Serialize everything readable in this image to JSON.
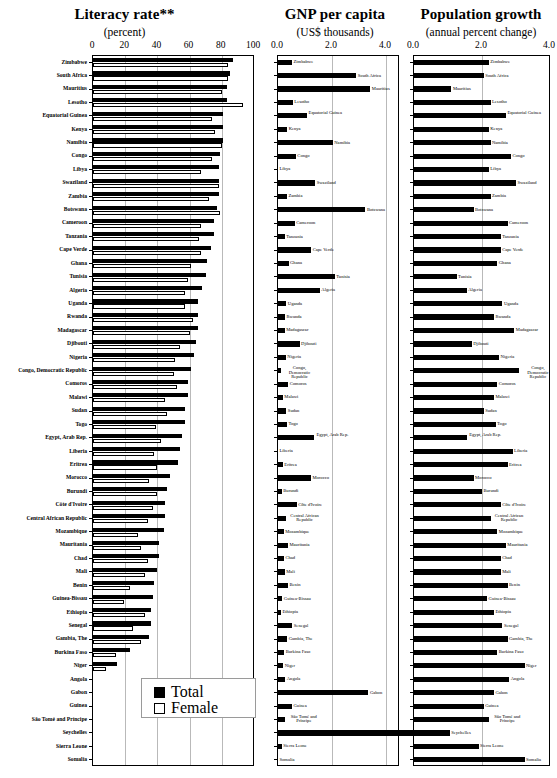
{
  "chart_data": [
    {
      "type": "bar",
      "title": "Literacy rate**",
      "subtitle": "(percent)",
      "xlabel": "percent",
      "ylabel": "",
      "orientation": "horizontal",
      "xlim": [
        0,
        100
      ],
      "xticks": [
        "0",
        "20",
        "40",
        "60",
        "80",
        "100"
      ],
      "grid": true,
      "legend": [
        "Total",
        "Female"
      ],
      "legend_position": "bottom-center",
      "categories": [
        "Zimbabwe",
        "South Africa",
        "Mauritius",
        "Lesotho",
        "Equatorial Guinea",
        "Kenya",
        "Namibia",
        "Congo",
        "Libya",
        "Swaziland",
        "Zambia",
        "Botswana",
        "Cameroon",
        "Tanzania",
        "Cape Verde",
        "Ghana",
        "Tunisia",
        "Algeria",
        "Uganda",
        "Rwanda",
        "Madagascar",
        "Djibouti",
        "Nigeria",
        "Congo, Democratic Republic",
        "Comoros",
        "Malawi",
        "Sudan",
        "Togo",
        "Egypt, Arab Rep.",
        "Liberia",
        "Eritrea",
        "Morocco",
        "Burundi",
        "Côte d'Ivoire",
        "Central African Republic",
        "Mozambique",
        "Mauritania",
        "Chad",
        "Mali",
        "Benin",
        "Guinea-Bissau",
        "Ethiopia",
        "Senegal",
        "Gambia, The",
        "Burkina Faso",
        "Niger",
        "Angola",
        "Gabon",
        "Guinea",
        "São Tomé and Príncipe",
        "Seychelles",
        "Sierra Leone",
        "Somalia"
      ],
      "series": [
        {
          "name": "Total",
          "values": [
            87,
            85,
            83,
            83,
            81,
            81,
            81,
            79,
            78,
            78,
            78,
            77,
            75,
            75,
            73,
            71,
            70,
            68,
            65,
            65,
            65,
            64,
            63,
            61,
            59,
            59,
            57,
            57,
            55,
            54,
            53,
            48,
            46,
            45,
            45,
            44,
            41,
            41,
            40,
            38,
            37,
            36,
            36,
            35,
            23,
            15,
            null,
            null,
            null,
            null,
            null,
            null,
            null
          ]
        },
        {
          "name": "Female",
          "values": [
            84,
            84,
            80,
            93,
            74,
            76,
            80,
            74,
            67,
            78,
            72,
            79,
            67,
            66,
            67,
            61,
            59,
            57,
            57,
            62,
            60,
            54,
            51,
            50,
            52,
            45,
            46,
            39,
            42,
            38,
            40,
            35,
            40,
            37,
            34,
            28,
            30,
            34,
            32,
            23,
            19,
            32,
            25,
            30,
            14,
            8,
            null,
            null,
            null,
            null,
            null,
            null,
            null
          ]
        }
      ]
    },
    {
      "type": "bar",
      "title": "GNP per capita",
      "subtitle": "(US$ thousands)",
      "xlabel": "US$ thousands",
      "ylabel": "",
      "orientation": "horizontal",
      "xlim": [
        0,
        4.4
      ],
      "xticks": [
        "0.0",
        "2.0",
        "4.0"
      ],
      "grid": true,
      "categories": [
        "Zimbabwe",
        "South Africa",
        "Mauritius",
        "Lesotho",
        "Equatorial Guinea",
        "Kenya",
        "Namibia",
        "Congo",
        "Libya",
        "Swaziland",
        "Zambia",
        "Botswana",
        "Cameroon",
        "Tanzania",
        "Cape Verde",
        "Ghana",
        "Tunisia",
        "Algeria",
        "Uganda",
        "Rwanda",
        "Madagascar",
        "Djibouti",
        "Nigeria",
        "Congo, Democratic Republic",
        "Comoros",
        "Malawi",
        "Sudan",
        "Togo",
        "Egypt, Arab Rep.",
        "Liberia",
        "Eritrea",
        "Morocco",
        "Burundi",
        "Côte d'Ivoire",
        "Central African Republic",
        "Mozambique",
        "Mauritania",
        "Chad",
        "Mali",
        "Benin",
        "Guinea-Bissau",
        "Ethiopia",
        "Senegal",
        "Gambia, The",
        "Burkina Faso",
        "Niger",
        "Angola",
        "Gabon",
        "Guinea",
        "São Tomé and Príncipe",
        "Seychelles",
        "Sierra Leone",
        "Somalia"
      ],
      "values": [
        0.52,
        2.9,
        3.42,
        0.55,
        1.07,
        0.34,
        2.03,
        0.66,
        0.0,
        1.38,
        0.33,
        3.24,
        0.62,
        0.25,
        1.23,
        0.39,
        2.1,
        1.55,
        0.31,
        0.26,
        0.25,
        0.8,
        0.29,
        0.11,
        0.38,
        0.18,
        0.31,
        0.33,
        1.33,
        0.0,
        0.18,
        1.22,
        0.14,
        0.69,
        0.3,
        0.21,
        0.37,
        0.22,
        0.25,
        0.37,
        0.16,
        0.11,
        0.53,
        0.34,
        0.23,
        0.19,
        0.27,
        3.35,
        0.52,
        0.27,
        6.5,
        0.14,
        0.0
      ]
    },
    {
      "type": "bar",
      "title": "Population growth",
      "subtitle": "(annual percent change)",
      "xlabel": "annual percent change",
      "ylabel": "",
      "orientation": "horizontal",
      "xlim": [
        0,
        4.0
      ],
      "xticks": [
        "0.0",
        "2.0",
        "4.0"
      ],
      "grid": true,
      "categories": [
        "Zimbabwe",
        "South Africa",
        "Mauritius",
        "Lesotho",
        "Equatorial Guinea",
        "Kenya",
        "Namibia",
        "Congo",
        "Libya",
        "Swaziland",
        "Zambia",
        "Botswana",
        "Cameroon",
        "Tanzania",
        "Cape Verde",
        "Ghana",
        "Tunisia",
        "Algeria",
        "Uganda",
        "Rwanda",
        "Madagascar",
        "Djibouti",
        "Nigeria",
        "Congo, Democratic Republic",
        "Comoros",
        "Malawi",
        "Sudan",
        "Togo",
        "Egypt, Arab Rep.",
        "Liberia",
        "Eritrea",
        "Morocco",
        "Burundi",
        "Côte d'Ivoire",
        "Central African Republic",
        "Mozambique",
        "Mauritania",
        "Chad",
        "Mali",
        "Benin",
        "Guinea-Bissau",
        "Ethiopia",
        "Senegal",
        "Gambia, The",
        "Burkina Faso",
        "Niger",
        "Angola",
        "Gabon",
        "Guinea",
        "São Tomé and Príncipe",
        "Seychelles",
        "Sierra Leone",
        "Somalia"
      ],
      "values": [
        2.2,
        2.05,
        1.1,
        2.25,
        2.7,
        2.2,
        2.25,
        2.85,
        2.2,
        3.0,
        2.25,
        1.75,
        2.75,
        2.55,
        2.55,
        2.45,
        1.25,
        1.55,
        2.6,
        2.35,
        2.95,
        1.7,
        2.5,
        3.1,
        2.45,
        2.35,
        2.05,
        2.4,
        1.55,
        2.9,
        2.75,
        1.75,
        2.0,
        2.55,
        2.25,
        2.45,
        2.7,
        2.55,
        2.55,
        2.75,
        2.15,
        2.35,
        2.6,
        2.75,
        2.45,
        3.25,
        2.8,
        2.35,
        2.05,
        2.2,
        1.05,
        1.9,
        3.25
      ]
    }
  ],
  "legend": {
    "total_label": "Total",
    "female_label": "Female"
  }
}
